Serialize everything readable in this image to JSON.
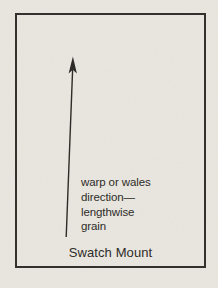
{
  "figure": {
    "arrow_label": {
      "lines": [
        "warp or wales",
        "direction—",
        "lengthwise",
        "grain"
      ]
    },
    "caption": "Swatch Mount"
  },
  "icons": {
    "arrow": "up-arrow-icon"
  },
  "colors": {
    "paper": "#e9e6e0",
    "ink": "#2e2c28",
    "border": "#33312d"
  }
}
